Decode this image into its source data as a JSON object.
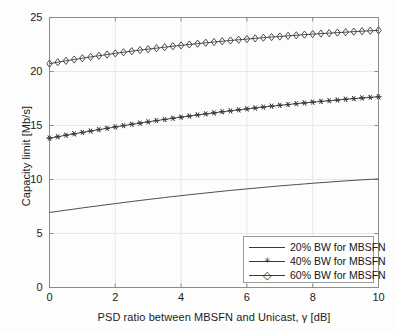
{
  "chart_data": {
    "type": "line",
    "title": "",
    "xlabel": "PSD ratio between MBSFN and Unicast, γ [dB]",
    "ylabel": "Capacity limit [Mb/s]",
    "xlim": [
      0,
      10
    ],
    "ylim": [
      0,
      25
    ],
    "xticks": [
      "0",
      "2",
      "4",
      "6",
      "8",
      "10"
    ],
    "xtick_values": [
      0,
      2,
      4,
      6,
      8,
      10
    ],
    "yticks": [
      "0",
      "5",
      "10",
      "15",
      "20",
      "25"
    ],
    "ytick_values": [
      0,
      5,
      10,
      15,
      20,
      25
    ],
    "grid": true,
    "legend_position": "lower right",
    "x": [
      0,
      0.25,
      0.5,
      0.75,
      1,
      1.25,
      1.5,
      1.75,
      2,
      2.25,
      2.5,
      2.75,
      3,
      3.25,
      3.5,
      3.75,
      4,
      4.25,
      4.5,
      4.75,
      5,
      5.25,
      5.5,
      5.75,
      6,
      6.25,
      6.5,
      6.75,
      7,
      7.25,
      7.5,
      7.75,
      8,
      8.25,
      8.5,
      8.75,
      9,
      9.25,
      9.5,
      9.75,
      10
    ],
    "series": [
      {
        "name": "20% BW for MBSFN",
        "marker": "none",
        "values": [
          6.95,
          7.05,
          7.16,
          7.26,
          7.37,
          7.47,
          7.57,
          7.67,
          7.77,
          7.87,
          7.96,
          8.06,
          8.15,
          8.24,
          8.33,
          8.42,
          8.5,
          8.59,
          8.67,
          8.75,
          8.83,
          8.91,
          8.99,
          9.06,
          9.13,
          9.2,
          9.27,
          9.34,
          9.41,
          9.47,
          9.53,
          9.59,
          9.65,
          9.71,
          9.76,
          9.82,
          9.87,
          9.92,
          9.97,
          10.01,
          10.05
        ]
      },
      {
        "name": "40% BW for MBSFN",
        "marker": "star",
        "values": [
          13.83,
          13.96,
          14.1,
          14.23,
          14.36,
          14.49,
          14.62,
          14.74,
          14.87,
          14.99,
          15.11,
          15.22,
          15.34,
          15.45,
          15.56,
          15.67,
          15.77,
          15.88,
          15.98,
          16.08,
          16.17,
          16.27,
          16.36,
          16.45,
          16.54,
          16.62,
          16.71,
          16.79,
          16.87,
          16.94,
          17.02,
          17.09,
          17.16,
          17.23,
          17.3,
          17.36,
          17.43,
          17.49,
          17.55,
          17.6,
          17.66
        ]
      },
      {
        "name": "60% BW for MBSFN",
        "marker": "diamond",
        "values": [
          20.73,
          20.86,
          20.99,
          21.11,
          21.23,
          21.35,
          21.46,
          21.57,
          21.68,
          21.78,
          21.88,
          21.98,
          22.07,
          22.16,
          22.25,
          22.34,
          22.42,
          22.5,
          22.58,
          22.66,
          22.73,
          22.8,
          22.87,
          22.94,
          23.0,
          23.07,
          23.13,
          23.19,
          23.24,
          23.3,
          23.35,
          23.41,
          23.46,
          23.51,
          23.55,
          23.6,
          23.64,
          23.69,
          23.73,
          23.77,
          23.81
        ]
      }
    ],
    "legend": [
      {
        "label": "20% BW for MBSFN",
        "marker": "none"
      },
      {
        "label": "40% BW for MBSFN",
        "marker": "star"
      },
      {
        "label": "60% BW for MBSFN",
        "marker": "diamond"
      }
    ],
    "colors": {
      "line": "#3a3a3a",
      "axis": "#8c8c8c",
      "grid": "#e8e8e8",
      "text": "#1b1b1b",
      "background": "#fdfdfd"
    }
  }
}
